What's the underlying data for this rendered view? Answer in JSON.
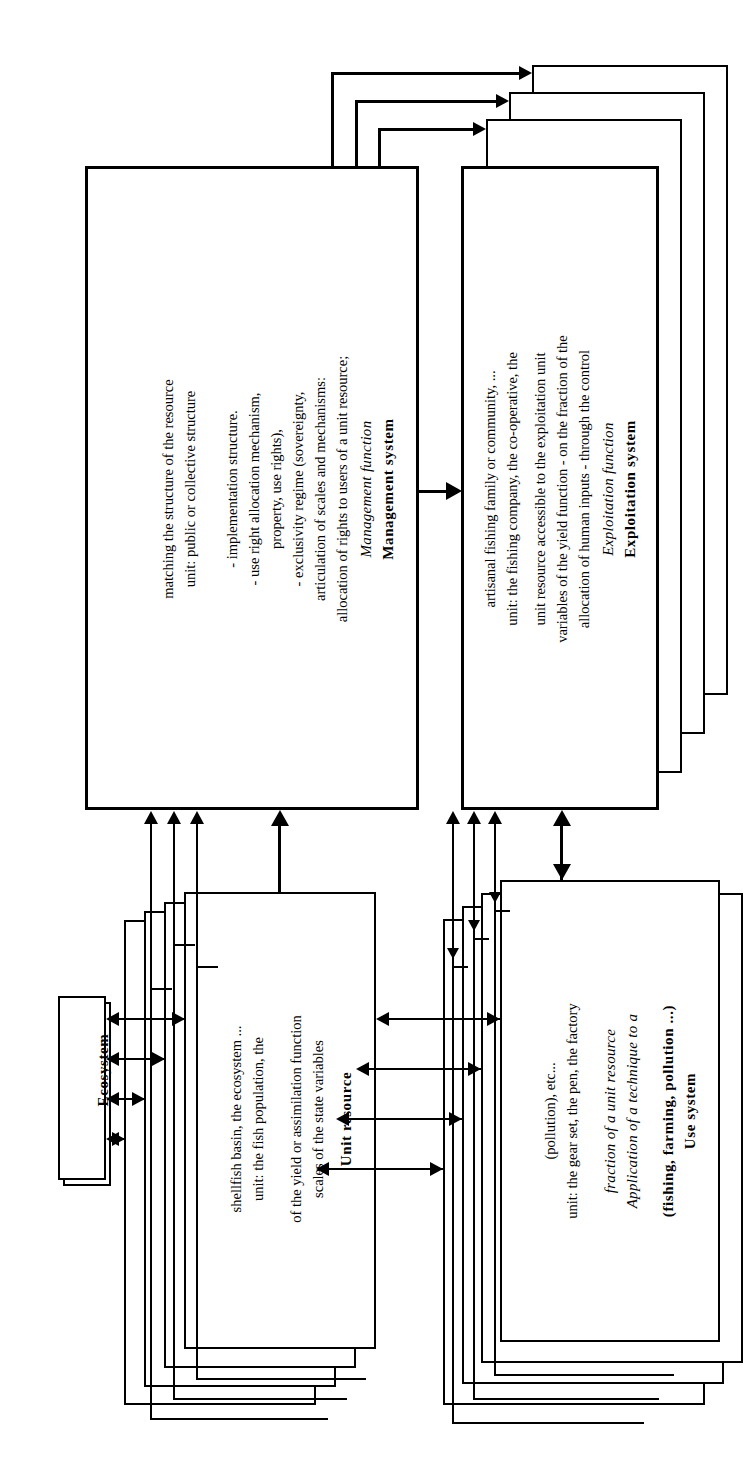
{
  "diagram": {
    "orientation": "text rotated 90 degrees counter-clockwise",
    "ink_color": "#000000",
    "background_color": "#ffffff"
  },
  "boxes": {
    "management": {
      "name": "Management system",
      "title": "Management system",
      "subtitle": "Management function",
      "lines": [
        "allocation of rights to users of a unit resource;",
        "articulation of scales and mechanisms:",
        "- exclusivity regime (sovereignty,",
        "property, use rights),",
        "- use right allocation mechanism,",
        "- implementation structure."
      ],
      "unit_lines": [
        "unit: public or collective structure",
        "matching the structure of the resource"
      ],
      "stack_layers": 0
    },
    "exploitation": {
      "name": "Exploitation system",
      "title": "Exploitation system",
      "subtitle": "Exploitation function",
      "lines": [
        "allocation of human inputs - through the control",
        "variables of the yield function - on the fraction of the",
        "unit resource accessible to the exploitation unit"
      ],
      "unit_lines": [
        "unit: the fishing company, the co-operative, the",
        "artisanal fishing family or community, ..."
      ],
      "stack_layers": 3
    },
    "unit_resource": {
      "name": "Unit resource",
      "title": "Unit resource",
      "subtitle": "",
      "lines": [
        "scales of the state variables",
        "of the yield or assimilation function"
      ],
      "unit_lines": [
        "unit: the fish population, the",
        "shellfish basin, the ecosystem ..."
      ],
      "stack_layers": 3
    },
    "use_system": {
      "name": "Use system",
      "title": "Use system",
      "title2": "(fishing, farming, pollution ...)",
      "subtitle": "Application of a technique to a",
      "subtitle2": "fraction of a unit resource",
      "unit_lines": [
        "unit: the gear set, the pen, the factory",
        "(pollution), etc..."
      ],
      "stack_layers": 3
    },
    "ecosystem": {
      "name": "Ecosystem",
      "title": "Ecosystem",
      "stack_layers": 1
    }
  },
  "connections": [
    {
      "from": "management",
      "to": "exploitation",
      "type": "single-arrow",
      "direction": "right"
    },
    {
      "from": "management",
      "to": "exploitation-layer-1",
      "type": "single-arrow",
      "direction": "right"
    },
    {
      "from": "management",
      "to": "exploitation-layer-2",
      "type": "single-arrow",
      "direction": "right"
    },
    {
      "from": "management",
      "to": "exploitation-layer-3",
      "type": "single-arrow",
      "direction": "right"
    },
    {
      "from": "unit_resource",
      "to": "management",
      "type": "single-arrow",
      "direction": "up"
    },
    {
      "from": "unit_resource-layers",
      "to": "management",
      "type": "single-arrow",
      "direction": "up"
    },
    {
      "from": "use_system",
      "to": "exploitation",
      "type": "double-arrow",
      "direction": "vertical"
    },
    {
      "from": "use_system-layers",
      "to": "exploitation",
      "type": "single-arrow",
      "direction": "up"
    },
    {
      "from": "ecosystem",
      "to": "unit_resource",
      "type": "double-arrow",
      "direction": "horizontal"
    },
    {
      "from": "unit_resource",
      "to": "use_system",
      "type": "double-arrow",
      "direction": "horizontal"
    }
  ]
}
